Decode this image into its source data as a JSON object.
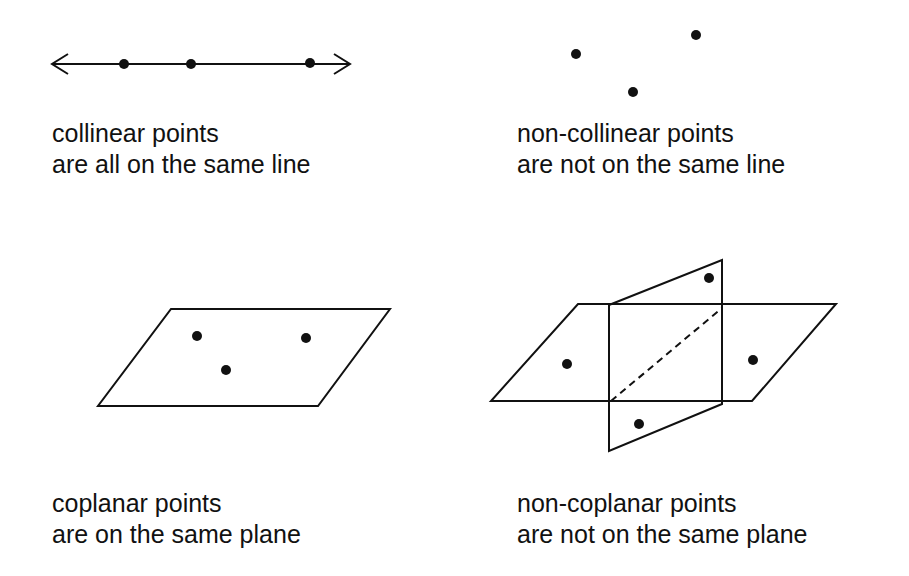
{
  "panels": {
    "collinear": {
      "title": "collinear points",
      "subtitle": "are all on the same line",
      "line": {
        "x1": 52,
        "x2": 350,
        "y": 64
      },
      "points": [
        [
          124,
          64
        ],
        [
          191,
          64
        ],
        [
          310,
          63
        ]
      ]
    },
    "non_collinear": {
      "title": "non-collinear points",
      "subtitle": "are not on the same line",
      "points": [
        [
          576,
          54
        ],
        [
          696,
          35
        ],
        [
          633,
          92
        ]
      ]
    },
    "coplanar": {
      "title": "coplanar points",
      "subtitle": "are on the same plane",
      "plane": [
        [
          171,
          309
        ],
        [
          390,
          309
        ],
        [
          318,
          406
        ],
        [
          98,
          406
        ]
      ],
      "points": [
        [
          197,
          336
        ],
        [
          306,
          338
        ],
        [
          226,
          370
        ]
      ]
    },
    "non_coplanar": {
      "title": "non-coplanar points",
      "subtitle": "are not on the same plane",
      "horizontal_plane": [
        [
          578,
          304
        ],
        [
          836,
          304
        ],
        [
          752,
          401
        ],
        [
          491,
          401
        ]
      ],
      "vertical_plane": [
        [
          609,
          305
        ],
        [
          722,
          260
        ],
        [
          722,
          404
        ],
        [
          609,
          451
        ]
      ],
      "intersection_dashed": [
        [
          611,
          401
        ],
        [
          722,
          308
        ]
      ],
      "points": [
        [
          709,
          278
        ],
        [
          567,
          364
        ],
        [
          753,
          360
        ],
        [
          639,
          424
        ]
      ]
    }
  },
  "colors": {
    "background": "#ffffff",
    "ink": "#111111"
  }
}
